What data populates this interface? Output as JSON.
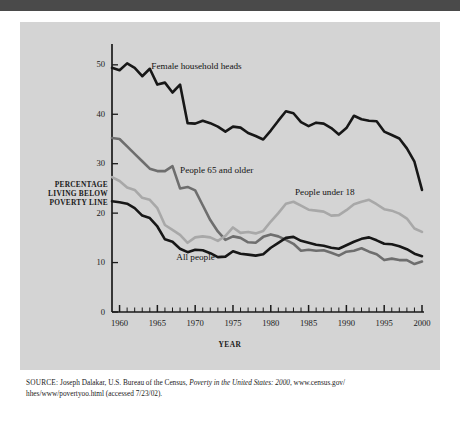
{
  "figure": {
    "y_axis_label": "PERCENTAGE\nLIVING BELOW\nPOVERTY LINE",
    "y_axis_label_lines": [
      "PERCENTAGE",
      "LIVING BELOW",
      "POVERTY LINE"
    ],
    "x_axis_label": "YEAR"
  },
  "source": {
    "prefix": "SOURCE:",
    "author": " Joseph Dalakar, U.S. Bureau of the Census, ",
    "title": "Poverty in the United States: 2000",
    "rest": ", www.census.gov/",
    "line2": "hhes/www/povertyoo.html (accessed 7/23/02)."
  },
  "colors": {
    "panel_background": "#d4d4d4",
    "top_bar": "#4a4a4a",
    "page_background": "#ffffff",
    "axis": "#1a1a1a",
    "female_household_heads": "#171717",
    "all_people": "#171717",
    "people_65_and_older": "#6e6e6e",
    "people_under_18": "#a8a8a8",
    "text": "#1a1a1a"
  },
  "chart_data": {
    "type": "line",
    "title": "",
    "xlabel": "YEAR",
    "ylabel": "PERCENTAGE LIVING BELOW POVERTY LINE",
    "xlim": [
      1959,
      2000
    ],
    "ylim": [
      0,
      53
    ],
    "yticks": [
      0,
      10,
      20,
      30,
      40,
      50
    ],
    "xticks": [
      1960,
      1965,
      1970,
      1975,
      1980,
      1985,
      1990,
      1995,
      2000
    ],
    "minor_xtick_interval": 1,
    "grid": false,
    "legend": "inline-annotations",
    "x": [
      1959,
      1960,
      1961,
      1962,
      1963,
      1964,
      1965,
      1966,
      1967,
      1968,
      1969,
      1970,
      1971,
      1972,
      1973,
      1974,
      1975,
      1976,
      1977,
      1978,
      1979,
      1980,
      1981,
      1982,
      1983,
      1984,
      1985,
      1986,
      1987,
      1988,
      1989,
      1990,
      1991,
      1992,
      1993,
      1994,
      1995,
      1996,
      1997,
      1998,
      1999,
      2000
    ],
    "series": [
      {
        "name": "Female household heads",
        "color": "#171717",
        "label_x": 1964.2,
        "label_y": 49.5,
        "values": [
          49.4,
          48.9,
          50.3,
          49.4,
          47.7,
          49.2,
          46.0,
          46.4,
          44.4,
          46.0,
          38.2,
          38.1,
          38.7,
          38.2,
          37.5,
          36.5,
          37.5,
          37.3,
          36.2,
          35.6,
          34.9,
          36.7,
          38.7,
          40.6,
          40.2,
          38.4,
          37.6,
          38.3,
          38.1,
          37.2,
          35.9,
          37.2,
          39.7,
          39.0,
          38.7,
          38.6,
          36.5,
          35.8,
          35.1,
          33.1,
          30.4,
          24.7
        ]
      },
      {
        "name": "People 65 and older",
        "color": "#6e6e6e",
        "label_x": 1968.0,
        "label_y": 28.6,
        "values": [
          35.2,
          35.0,
          33.5,
          32.0,
          30.5,
          29.0,
          28.5,
          28.5,
          29.5,
          25.0,
          25.3,
          24.6,
          21.6,
          18.6,
          16.3,
          14.6,
          15.3,
          15.0,
          14.1,
          14.0,
          15.2,
          15.7,
          15.3,
          14.6,
          13.8,
          12.4,
          12.6,
          12.4,
          12.5,
          12.0,
          11.4,
          12.2,
          12.4,
          12.9,
          12.2,
          11.7,
          10.5,
          10.8,
          10.5,
          10.5,
          9.7,
          10.2
        ]
      },
      {
        "name": "People under 18",
        "color": "#a8a8a8",
        "label_x": 1983.2,
        "label_y": 24.0,
        "values": [
          27.3,
          26.5,
          25.2,
          24.7,
          23.1,
          22.7,
          21.0,
          17.6,
          16.6,
          15.6,
          14.0,
          15.1,
          15.3,
          15.1,
          14.4,
          15.4,
          17.1,
          16.0,
          16.2,
          15.9,
          16.4,
          18.3,
          20.0,
          21.9,
          22.3,
          21.5,
          20.7,
          20.5,
          20.3,
          19.5,
          19.6,
          20.6,
          21.8,
          22.3,
          22.7,
          21.8,
          20.8,
          20.5,
          19.9,
          18.9,
          16.9,
          16.2
        ]
      },
      {
        "name": "All people",
        "color": "#171717",
        "label_x": 1967.5,
        "label_y": 11.0,
        "values": [
          22.4,
          22.2,
          21.9,
          21.0,
          19.5,
          19.0,
          17.3,
          14.7,
          14.2,
          12.8,
          12.1,
          12.6,
          12.5,
          11.9,
          11.1,
          11.2,
          12.3,
          11.8,
          11.6,
          11.4,
          11.7,
          13.0,
          14.0,
          15.0,
          15.2,
          14.4,
          14.0,
          13.6,
          13.4,
          13.0,
          12.8,
          13.5,
          14.2,
          14.8,
          15.1,
          14.5,
          13.8,
          13.7,
          13.3,
          12.7,
          11.8,
          11.3
        ]
      }
    ]
  }
}
